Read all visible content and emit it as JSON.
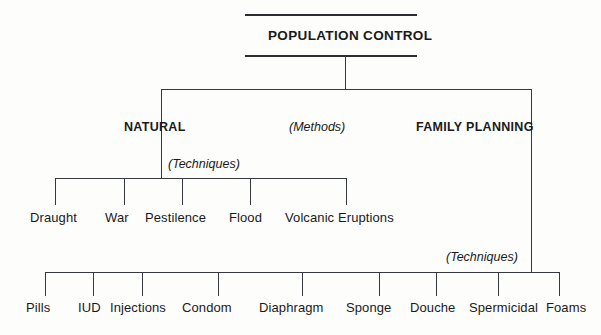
{
  "diagram": {
    "type": "hierarchy-tree",
    "root": {
      "label": "POPULATION CONTROL"
    },
    "level_annotation": {
      "label": "(Methods)"
    },
    "branches": [
      {
        "id": "natural",
        "label": "NATURAL",
        "annotation": "(Techniques)",
        "children": [
          "Draught",
          "War",
          "Pestilence",
          "Flood",
          "Volcanic Eruptions"
        ]
      },
      {
        "id": "family-planning",
        "label": "FAMILY PLANNING",
        "annotation": "(Techniques)",
        "children": [
          "Pills",
          "IUD",
          "Injections",
          "Condom",
          "Diaphragm",
          "Sponge",
          "Douche",
          "Spermicidal",
          "Foams"
        ]
      }
    ],
    "colors": {
      "line": "#35383c",
      "text": "#1a1a1a",
      "background": "#fdfdfc"
    }
  }
}
